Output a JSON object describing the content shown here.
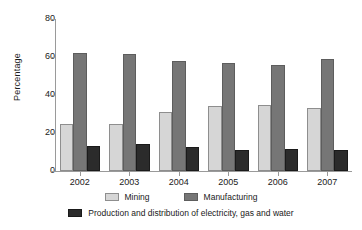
{
  "chart_data": {
    "type": "bar",
    "title": "",
    "subtitle": "",
    "xlabel": "",
    "ylabel": "Percentage",
    "categories": [
      "2002",
      "2003",
      "2004",
      "2005",
      "2006",
      "2007"
    ],
    "series": [
      {
        "name": "Mining",
        "color": "#d6d6d6",
        "values": [
          24.6,
          24.8,
          30.8,
          34.0,
          34.7,
          33.2
        ]
      },
      {
        "name": "Manufacturing",
        "color": "#767676",
        "values": [
          62.3,
          61.8,
          57.7,
          56.9,
          55.9,
          59.1
        ]
      },
      {
        "name": "Production and distribution of electricity, gas and water",
        "color": "#2b2b2b",
        "values": [
          13.4,
          14.0,
          12.9,
          11.3,
          11.6,
          11.0
        ]
      }
    ],
    "ylim": [
      0,
      80
    ],
    "yticks": [
      0,
      20,
      40,
      60,
      80
    ],
    "grid": false,
    "legend_position": "bottom"
  },
  "axis": {
    "y_title": "Percentage",
    "y_tick_labels": [
      "80",
      "60",
      "40",
      "20",
      "0"
    ],
    "x_tick_labels": [
      "2002",
      "2003",
      "2004",
      "2005",
      "2006",
      "2007"
    ]
  },
  "legend": {
    "row1": [
      {
        "label": "Mining",
        "swatch": "mining"
      },
      {
        "label": "Manufacturing",
        "swatch": "manufacturing"
      }
    ],
    "row2": [
      {
        "label": "Production and distribution of electricity, gas and water",
        "swatch": "production"
      }
    ]
  },
  "colors": {
    "mining": "#d6d6d6",
    "manufacturing": "#767676",
    "production": "#2b2b2b",
    "axis": "#9a9a9a",
    "text": "#1a1a1a",
    "background": "#ffffff"
  }
}
